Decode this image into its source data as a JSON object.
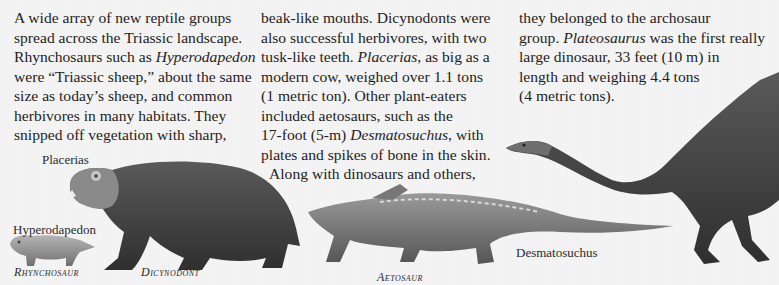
{
  "columns": [
    {
      "lines": [
        {
          "text": "A wide array of new reptile groups"
        },
        {
          "text": "spread across the Triassic landscape."
        },
        {
          "pre": "Rhynchosaurs such as ",
          "italic": "Hyperodapedon",
          "post": ""
        },
        {
          "text": "were “Triassic sheep,” about the same"
        },
        {
          "text": "size as today’s sheep, and common"
        },
        {
          "text": "herbivores in many habitats. They"
        },
        {
          "text": "snipped off vegetation with sharp,"
        }
      ]
    },
    {
      "lines": [
        {
          "text": "beak-like mouths. Dicynodonts were"
        },
        {
          "text": "also successful herbivores, with two"
        },
        {
          "pre": "tusk-like teeth. ",
          "italic": "Placerias",
          "post": ", as big as a"
        },
        {
          "text": "modern cow, weighed over 1.1 tons"
        },
        {
          "text": "(1 metric ton). Other plant-eaters"
        },
        {
          "text": "included aetosaurs, such as the"
        },
        {
          "pre": "17-foot (5-m) ",
          "italic": "Desmatosuchus",
          "post": ", with"
        },
        {
          "text": "plates and spikes of bone in the skin."
        },
        {
          "text": "Along with dinosaurs and others,"
        }
      ]
    },
    {
      "lines": [
        {
          "text": "they belonged to the archosaur"
        },
        {
          "pre": "group. ",
          "italic": "Plateosaurus",
          "post": " was the first really"
        },
        {
          "text": "large dinosaur, 33 feet (10 m) in"
        },
        {
          "text": "length and weighing 4.4 tons"
        },
        {
          "text": "(4 metric tons)."
        }
      ]
    }
  ],
  "labels": {
    "placerias": "Placerias",
    "hyperodapedon": "Hyperodapedon",
    "desmatosuchus": "Desmatosuchus",
    "rhynchosaur": "Rhynchosaur",
    "dicynodont": "Dicynodont",
    "aetosaur": "Aetosaur"
  },
  "colors": {
    "background": "#f4f4f4",
    "text": "#1e1e1e",
    "creature_dark": "#4a4a4a",
    "creature_mid": "#7a7a7a",
    "creature_light": "#a8a8a8"
  }
}
